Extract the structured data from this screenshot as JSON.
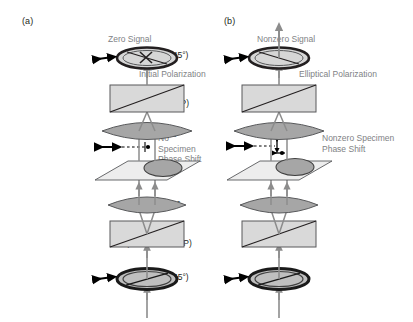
{
  "figure": {
    "width": 413,
    "height": 322,
    "background": "#ffffff"
  },
  "colors": {
    "label_text": "#231f20",
    "annotation_text": "#808285",
    "beam_gray": "#8c8c8c",
    "lens_fill": "#a6a6a6",
    "prism_fill": "#d9d9d9",
    "specimen_plane_fill": "#ededed",
    "polarizer_ring": "#1a1a1a",
    "polarizer_fill": "#bfbfbf",
    "outline": "#58595b",
    "arrow_black": "#000000"
  },
  "row_labels": [
    {
      "id": "analyzer",
      "text": "Analyzer (−45°)",
      "y": 55
    },
    {
      "id": "prism-objective",
      "text": "Prism\n(Objective BFP)",
      "y": 92
    },
    {
      "id": "objective",
      "text": "Objective",
      "y": 134
    },
    {
      "id": "specimen",
      "text": "Specimen",
      "y": 168
    },
    {
      "id": "condenser",
      "text": "Condenser",
      "y": 203
    },
    {
      "id": "prism-condenser",
      "text": "Prism\n(Condenser FFP)",
      "y": 232
    },
    {
      "id": "polarizer",
      "text": "Polarizer (+45°)",
      "y": 277
    }
  ],
  "panel_a": {
    "letter": "(a)",
    "signal_label": "Zero Signal",
    "polarization_label": "Initial Polarization",
    "phase_shift_label": "No Specimen\nPhase Shift",
    "analyzer_state": "crossed",
    "output_beam": "blocked",
    "specimen_phase_shift": "none"
  },
  "panel_b": {
    "letter": "(b)",
    "signal_label": "Nonzero Signal",
    "polarization_label": "Elliptical Polarization",
    "phase_shift_label": "Nonzero Specimen\nPhase Shift",
    "analyzer_state": "open",
    "output_beam": "transmitted",
    "specimen_phase_shift": "nonzero"
  }
}
